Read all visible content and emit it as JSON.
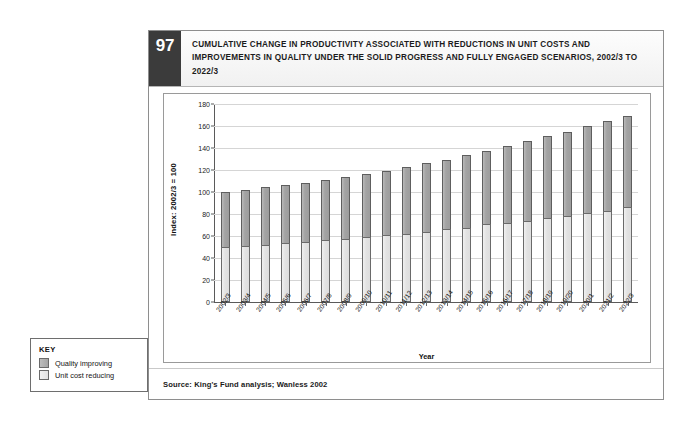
{
  "figure": {
    "number": "97",
    "title": "CUMULATIVE CHANGE IN PRODUCTIVITY ASSOCIATED WITH REDUCTIONS IN UNIT COSTS AND IMPROVEMENTS IN QUALITY UNDER THE SOLID PROGRESS AND FULLY ENGAGED SCENARIOS, 2002/3 TO 2022/3",
    "source": "Source: King's Fund analysis; Wanless 2002"
  },
  "key": {
    "title": "KEY",
    "items": [
      {
        "label": "Quality improving",
        "color": "#a5a5a5"
      },
      {
        "label": "Unit cost reducing",
        "color": "#e2e2e2"
      }
    ]
  },
  "chart_data": {
    "type": "bar",
    "stacked": true,
    "title": "Cumulative change in productivity associated with reductions in unit costs and improvements in quality under the solid progress and fully engaged scenarios, 2002/3 to 2022/3",
    "xlabel": "Year",
    "ylabel": "Index: 2002/3 = 100",
    "ylim": [
      0,
      180
    ],
    "yticks": [
      0,
      20,
      40,
      60,
      80,
      100,
      120,
      140,
      160,
      180
    ],
    "grid": true,
    "legend_position": "outside-bottom-left",
    "categories": [
      "2002/3",
      "2003/4",
      "2004/5",
      "2005/6",
      "2006/7",
      "2007/8",
      "2008/9",
      "2009/10",
      "2010/11",
      "2011/12",
      "2012/13",
      "2013/14",
      "2014/15",
      "2015/16",
      "2016/17",
      "2017/18",
      "2018/19",
      "2019/20",
      "2020/1",
      "2021/2",
      "2022/3"
    ],
    "series": [
      {
        "name": "Unit cost reducing",
        "color": "#e2e2e2",
        "values": [
          50,
          51,
          52,
          54,
          55,
          56,
          57.5,
          59,
          61,
          62,
          64,
          66,
          67.5,
          70.5,
          72,
          74,
          76.5,
          78.5,
          81,
          83,
          86
        ]
      },
      {
        "name": "Quality improving",
        "color": "#a5a5a5",
        "values": [
          50,
          51,
          53,
          52.5,
          53.5,
          55,
          56.5,
          57.5,
          58.5,
          61,
          62,
          63.5,
          66.5,
          67,
          70,
          72.5,
          74,
          76.5,
          79,
          82,
          83.5
        ]
      }
    ],
    "totals": [
      100,
      102,
      105,
      106.5,
      108.5,
      111,
      114,
      116.5,
      119.5,
      123,
      126,
      129.5,
      134,
      137.5,
      142,
      146.5,
      150.5,
      155,
      160,
      165,
      169.5
    ]
  }
}
